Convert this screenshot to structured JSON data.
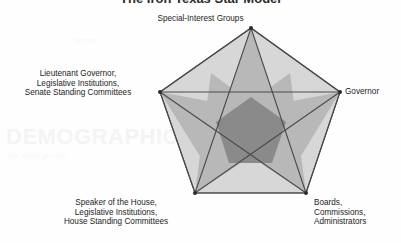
{
  "page": {
    "title": "The Iron Texas Star Model",
    "background_color": "#fefefe"
  },
  "ghost_text": {
    "heading_left": "DEMOGRAPHIC",
    "line_left": "the rapid growth",
    "word_mid": "Texas"
  },
  "diagram": {
    "name": "iron-texas-star",
    "shape": "pentagram-in-pentagon",
    "colors": {
      "outer_pentagon_fill": "#d5d5d5",
      "star_arm_fill": "#b8b8b8",
      "inner_core_fill": "#8a8a8a",
      "stroke": "#4a4a4a",
      "vertex_dot": "#2b2b2b"
    },
    "nodes": [
      {
        "id": "special-interest-groups",
        "lines": [
          "Special-Interest Groups"
        ],
        "position": "top"
      },
      {
        "id": "governor",
        "lines": [
          "Governor"
        ],
        "position": "right"
      },
      {
        "id": "boards-commissions-administrators",
        "lines": [
          "Boards,",
          "Commissions,",
          "Administrators"
        ],
        "position": "bottom-right"
      },
      {
        "id": "speaker-of-the-house",
        "lines": [
          "Speaker of the House,",
          "Legislative Institutions,",
          "House Standing Committees"
        ],
        "position": "bottom-left"
      },
      {
        "id": "lieutenant-governor",
        "lines": [
          "Lieutenant Governor,",
          "Legislative Institutions,",
          "Senate Standing Committees"
        ],
        "position": "left"
      }
    ]
  }
}
